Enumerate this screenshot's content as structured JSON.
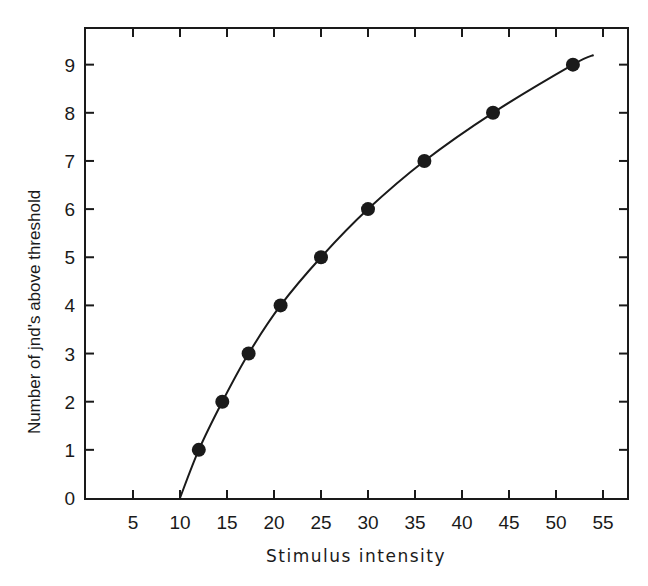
{
  "chart_data": {
    "type": "line",
    "title": "",
    "xlabel": "Stimulus intensity",
    "ylabel": "Number of jnd's above threshold",
    "xlim": [
      0,
      58
    ],
    "ylim": [
      0,
      9.7
    ],
    "x_ticks": [
      5,
      10,
      15,
      20,
      25,
      30,
      35,
      40,
      45,
      50,
      55
    ],
    "y_ticks": [
      0,
      1,
      2,
      3,
      4,
      5,
      6,
      7,
      8,
      9
    ],
    "grid": false,
    "legend": null,
    "series": [
      {
        "name": "data points",
        "style": "scatter",
        "x": [
          12,
          14.5,
          17.3,
          20.7,
          25,
          30,
          36,
          43.3,
          51.8
        ],
        "y": [
          1,
          2,
          3,
          4,
          5,
          6,
          7,
          8,
          9
        ]
      },
      {
        "name": "fitted curve",
        "style": "line",
        "x": [
          10,
          12,
          14.5,
          17.3,
          20.7,
          25,
          30,
          36,
          43.3,
          51.8,
          54
        ],
        "y": [
          0,
          1,
          2,
          3,
          4,
          5,
          6,
          7,
          8,
          9,
          9.2
        ]
      }
    ]
  },
  "colors": {
    "ink": "#1a1a1a",
    "background": "#ffffff"
  }
}
